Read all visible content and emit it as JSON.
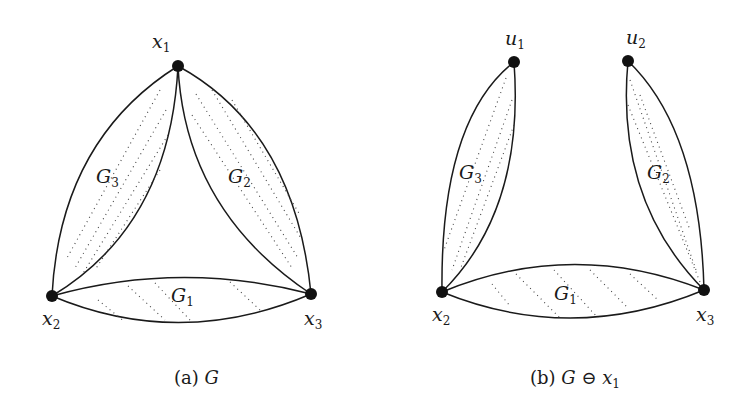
{
  "figure": {
    "panel_a": {
      "caption_prefix": "(a) ",
      "caption_math": "G",
      "nodes": [
        {
          "id": "x1",
          "label": "x",
          "sub": "1"
        },
        {
          "id": "x2",
          "label": "x",
          "sub": "2"
        },
        {
          "id": "x3",
          "label": "x",
          "sub": "3"
        }
      ],
      "regions": [
        {
          "id": "G1",
          "label": "G",
          "sub": "1"
        },
        {
          "id": "G2",
          "label": "G",
          "sub": "2"
        },
        {
          "id": "G3",
          "label": "G",
          "sub": "3"
        }
      ]
    },
    "panel_b": {
      "caption_prefix": "(b) ",
      "caption_math": "G ⊖ x",
      "caption_sub": "1",
      "nodes": [
        {
          "id": "u1",
          "label": "u",
          "sub": "1"
        },
        {
          "id": "u2",
          "label": "u",
          "sub": "2"
        },
        {
          "id": "x2",
          "label": "x",
          "sub": "2"
        },
        {
          "id": "x3",
          "label": "x",
          "sub": "3"
        }
      ],
      "regions": [
        {
          "id": "G1",
          "label": "G",
          "sub": "1"
        },
        {
          "id": "G2",
          "label": "G",
          "sub": "2"
        },
        {
          "id": "G3",
          "label": "G",
          "sub": "3"
        }
      ]
    }
  }
}
